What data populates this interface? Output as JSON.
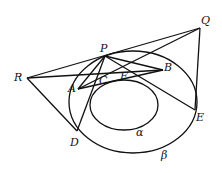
{
  "diagram": {
    "points": {
      "P": {
        "label": "P",
        "x": 105,
        "y": 56
      },
      "Q": {
        "label": "Q",
        "x": 200,
        "y": 28
      },
      "R": {
        "label": "R",
        "x": 27,
        "y": 78
      },
      "A": {
        "label": "A",
        "x": 78,
        "y": 89
      },
      "B": {
        "label": "B",
        "x": 163,
        "y": 70
      },
      "C": {
        "label": "C",
        "x": 101,
        "y": 80
      },
      "F": {
        "label": "F",
        "x": 121,
        "y": 77
      },
      "D": {
        "label": "D",
        "x": 77,
        "y": 131
      },
      "E": {
        "label": "E",
        "x": 195,
        "y": 110
      }
    },
    "curves": {
      "alpha": {
        "label": "α"
      },
      "beta": {
        "label": "β"
      }
    }
  }
}
